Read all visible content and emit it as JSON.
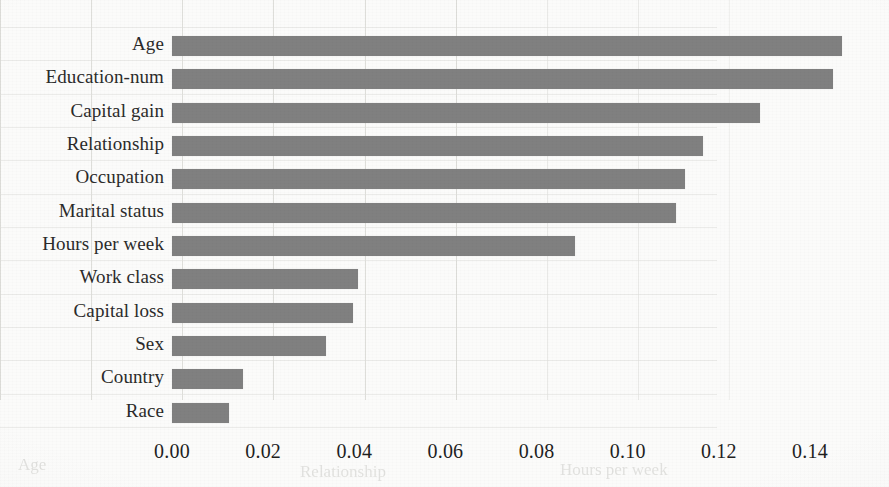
{
  "chart_data": {
    "type": "bar",
    "orientation": "horizontal",
    "title": "",
    "subtitle": "",
    "xlabel": "",
    "ylabel": "",
    "categories": [
      "Age",
      "Education-num",
      "Capital gain",
      "Relationship",
      "Occupation",
      "Marital status",
      "Hours per week",
      "Work class",
      "Capital loss",
      "Sex",
      "Country",
      "Race"
    ],
    "values": [
      0.147,
      0.145,
      0.129,
      0.1165,
      0.1125,
      0.1105,
      0.0885,
      0.0408,
      0.0398,
      0.0338,
      0.0156,
      0.0125
    ],
    "series": [
      {
        "name": "Feature importance",
        "values": [
          0.147,
          0.145,
          0.129,
          0.1165,
          0.1125,
          0.1105,
          0.0885,
          0.0408,
          0.0398,
          0.0338,
          0.0156,
          0.0125
        ]
      }
    ],
    "xticks": [
      0.0,
      0.02,
      0.04,
      0.06,
      0.08,
      0.1,
      0.12,
      0.14
    ],
    "xticklabels": [
      "0.00",
      "0.02",
      "0.04",
      "0.06",
      "0.08",
      "0.10",
      "0.12",
      "0.14"
    ],
    "xlim": [
      0.0,
      0.14
    ],
    "grid": {
      "vertical": true,
      "horizontal": false
    },
    "legend": {
      "visible": false,
      "position": "none"
    },
    "annotations": [],
    "colors": {
      "bar": "#808080",
      "background": "#fbfbfa",
      "gridline": "#d8d8d4",
      "text": "#2b2b2b"
    }
  },
  "bleed_text": {
    "bottom_left": "Age",
    "bottom_mid": "Relationship",
    "bottom_right": "Hours per week"
  }
}
